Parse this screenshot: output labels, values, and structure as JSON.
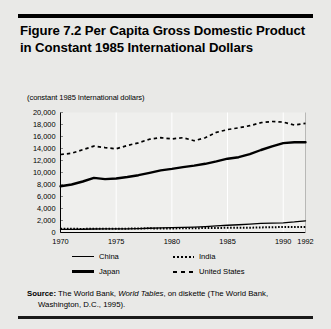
{
  "figure": {
    "title": "Figure 7.2  Per Capita Gross Domestic Product in Constant 1985 International Dollars",
    "axis_note": "(constant 1985 International dollars)"
  },
  "source": {
    "label": "Source:",
    "text_before_italic": " The World Bank, ",
    "italic_text": "World Tables",
    "text_after_italic": ", on diskette (The World Bank,",
    "line2": "Washington, D.C., 1995)."
  },
  "chart_data": {
    "type": "line",
    "title": "Figure 7.2  Per Capita Gross Domestic Product in Constant 1985 International Dollars",
    "xlabel": "",
    "ylabel": "(constant 1985 International dollars)",
    "xlim": [
      1970,
      1992
    ],
    "ylim": [
      0,
      20000
    ],
    "ytick_values": [
      0,
      2000,
      4000,
      6000,
      8000,
      10000,
      12000,
      14000,
      16000,
      18000,
      20000
    ],
    "ytick_labels": [
      "0",
      "2,000",
      "4,000",
      "6,000",
      "8,000",
      "10,000",
      "12,000",
      "14,000",
      "16,000",
      "18,000",
      "20,000"
    ],
    "xtick_values": [
      1970,
      1975,
      1980,
      1985,
      1990,
      1992
    ],
    "xtick_labels": [
      "1970",
      "1975",
      "1980",
      "1985",
      "1990",
      "1992"
    ],
    "grid": "vertical-only",
    "legend_position": "below-axes",
    "x": [
      1970,
      1971,
      1972,
      1973,
      1974,
      1975,
      1976,
      1977,
      1978,
      1979,
      1980,
      1981,
      1982,
      1983,
      1984,
      1985,
      1986,
      1987,
      1988,
      1989,
      1990,
      1991,
      1992
    ],
    "series": [
      {
        "name": "China",
        "style": "thin-solid",
        "color": "#000000",
        "values": [
          520,
          530,
          540,
          580,
          590,
          620,
          610,
          650,
          710,
          760,
          810,
          850,
          910,
          990,
          1100,
          1210,
          1290,
          1400,
          1520,
          1570,
          1620,
          1760,
          1950
        ]
      },
      {
        "name": "Japan",
        "style": "thick-solid",
        "color": "#000000",
        "values": [
          7700,
          8000,
          8500,
          9100,
          8900,
          9000,
          9250,
          9550,
          9950,
          10350,
          10600,
          10900,
          11150,
          11450,
          11850,
          12300,
          12550,
          13050,
          13750,
          14350,
          14900,
          15050,
          15050
        ]
      },
      {
        "name": "India",
        "style": "dotted",
        "color": "#000000",
        "values": [
          620,
          610,
          600,
          615,
          610,
          645,
          640,
          675,
          700,
          660,
          680,
          700,
          710,
          745,
          760,
          780,
          790,
          800,
          850,
          880,
          910,
          900,
          930
        ]
      },
      {
        "name": "United States",
        "style": "dashed",
        "color": "#000000",
        "values": [
          13000,
          13200,
          13800,
          14400,
          14150,
          13950,
          14500,
          14950,
          15550,
          15800,
          15600,
          15800,
          15300,
          15800,
          16700,
          17150,
          17450,
          17800,
          18300,
          18500,
          18400,
          17900,
          18200
        ]
      }
    ],
    "legend": [
      {
        "label": "China",
        "style": "thin-solid"
      },
      {
        "label": "India",
        "style": "dotted"
      },
      {
        "label": "Japan",
        "style": "thick-solid"
      },
      {
        "label": "United States",
        "style": "dashed"
      }
    ]
  }
}
